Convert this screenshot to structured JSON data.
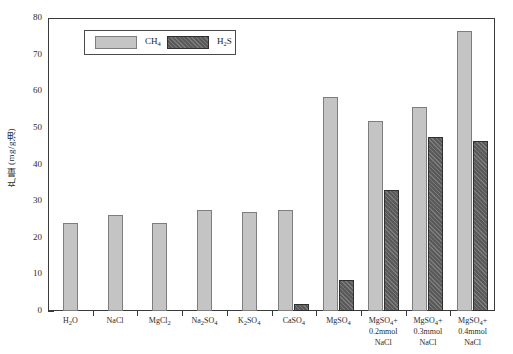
{
  "chart_data": {
    "type": "bar",
    "title": "",
    "xlabel": "",
    "ylabel": "产量 (mg/g油)",
    "ylim": [
      0,
      80
    ],
    "ytick_step": 10,
    "yticks": [
      0,
      10,
      20,
      30,
      40,
      50,
      60,
      70,
      80
    ],
    "grid": false,
    "legend_position": "top-left-inside",
    "categories": [
      "H₂O",
      "NaCl",
      "MgCl₂",
      "Na₂SO₄",
      "K₂SO₄",
      "CaSO₄",
      "MgSO₄",
      "MgSO₄+\n0.2mmol\nNaCl",
      "MgSO₄+\n0.3mmol\nNaCl",
      "MgSO₄+\n0.4mmol\nNaCl"
    ],
    "series": [
      {
        "name": "CH₄",
        "color": "#c4c4c4",
        "values": [
          24.0,
          26.3,
          24.1,
          27.5,
          27.0,
          27.5,
          58.5,
          52.0,
          55.7,
          76.5
        ]
      },
      {
        "name": "H₂S",
        "color": "#5a5a5a",
        "values": [
          0,
          0,
          0,
          0,
          0,
          1.8,
          8.5,
          33.0,
          47.5,
          46.5
        ]
      }
    ]
  },
  "legend": {
    "entries": [
      {
        "label_html": "CH<sub>4</sub>",
        "label": "CH4",
        "swatch": "ch4"
      },
      {
        "label_html": "H<sub>2</sub>S",
        "label": "H2S",
        "swatch": "h2s"
      }
    ]
  },
  "axis": {
    "y_title_html": "产量 (mg/g油)"
  },
  "x_labels_html": [
    "H<sub>2</sub>O",
    "NaCl",
    "MgCl<sub>2</sub>",
    "Na<sub>2</sub>SO<sub>4</sub>",
    "K<sub>2</sub>SO<sub>4</sub>",
    "CaSO<sub>4</sub>",
    "MgSO<sub>4</sub>",
    "MgSO<sub>4</sub>+<br>0.2mmol<br>NaCl",
    "MgSO<sub>4</sub>+<br>0.3mmol<br>NaCl",
    "MgSO<sub>4</sub>+<br>0.4mmol<br>NaCl"
  ]
}
